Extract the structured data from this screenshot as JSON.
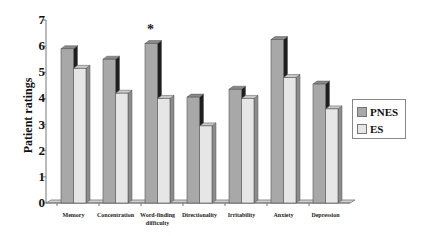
{
  "chart_data": {
    "type": "bar",
    "title": "",
    "xlabel": "",
    "ylabel": "Patient ratings",
    "ylim": [
      0,
      7
    ],
    "yticks": [
      "0",
      "1",
      "2",
      "3",
      "4",
      "5",
      "6",
      "7"
    ],
    "grid": false,
    "style": "3d-clustered",
    "legend_position": "right",
    "categories": [
      "Memory",
      "Concentration",
      "Word-finding difficulty",
      "Directionality",
      "Irritability",
      "Anxiety",
      "Depression"
    ],
    "category_labels": [
      [
        "Memory"
      ],
      [
        "Concentration"
      ],
      [
        "Word-finding",
        "difficulty"
      ],
      [
        "Directionality"
      ],
      [
        "Irritability"
      ],
      [
        "Anxiety"
      ],
      [
        "Depression"
      ]
    ],
    "series": [
      {
        "name": "PNES",
        "values": [
          5.9,
          5.5,
          6.1,
          4.05,
          4.35,
          6.25,
          4.55
        ],
        "color": "#a8a8a8"
      },
      {
        "name": "ES",
        "values": [
          5.15,
          4.2,
          4.0,
          2.95,
          4.0,
          4.8,
          3.6
        ],
        "color": "#e6e6e6"
      }
    ],
    "annotations": [
      {
        "category": "Word-finding difficulty",
        "text": "*"
      }
    ]
  },
  "legend": {
    "items": [
      {
        "label": "PNES"
      },
      {
        "label": "ES"
      }
    ]
  }
}
